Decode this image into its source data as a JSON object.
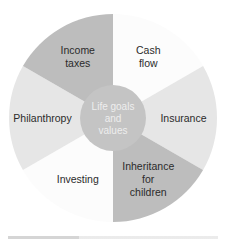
{
  "diagram": {
    "type": "wheel",
    "center": {
      "lines": [
        "Life goals",
        "and",
        "values"
      ],
      "color": "#c4c4c4",
      "text_color": "#eeeeee"
    },
    "segments": [
      {
        "name": "cash-flow",
        "lines": [
          "Cash",
          "flow"
        ],
        "color": "#fcfcfc"
      },
      {
        "name": "insurance",
        "lines": [
          "Insurance"
        ],
        "color": "#e6e6e6"
      },
      {
        "name": "inheritance-for-children",
        "lines": [
          "Inheritance",
          "for",
          "children"
        ],
        "color": "#bdbdbd"
      },
      {
        "name": "investing",
        "lines": [
          "Investing"
        ],
        "color": "#fcfcfc"
      },
      {
        "name": "philanthropy",
        "lines": [
          "Philanthropy"
        ],
        "color": "#e6e6e6"
      },
      {
        "name": "income-taxes",
        "lines": [
          "Income",
          "taxes"
        ],
        "color": "#bdbdbd"
      }
    ]
  }
}
